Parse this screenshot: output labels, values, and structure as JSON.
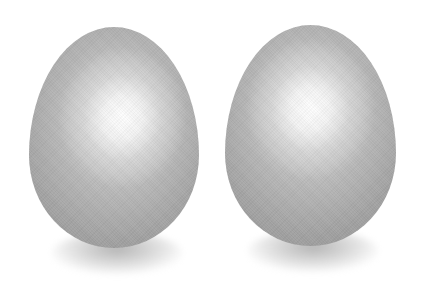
{
  "scene": {
    "background_color": "#ffffff",
    "subject": "two eggs",
    "eggs": [
      {
        "id": "left",
        "color_edge": "#9a9a9a",
        "color_mid": "#b8b8b8",
        "highlight_color": "#ffffff"
      },
      {
        "id": "right",
        "color_edge": "#9a9a9a",
        "color_mid": "#b8b8b8",
        "highlight_color": "#ffffff"
      }
    ]
  }
}
